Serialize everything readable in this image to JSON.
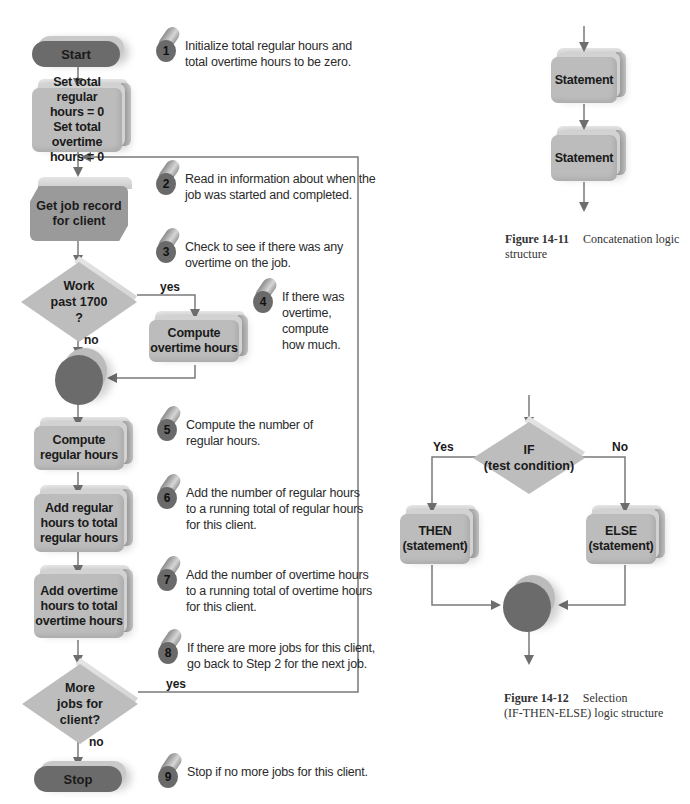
{
  "flowchart": {
    "start": "Start",
    "init": "Set total regular\nhours = 0\nSet total overtime\nhours = 0",
    "get_job": "Get job record\nfor client",
    "decision_overtime": "Work\npast 1700\n?",
    "compute_overtime": "Compute\novertime hours",
    "compute_regular": "Compute\nregular hours",
    "add_regular": "Add regular\nhours to total\nregular hours",
    "add_overtime": "Add overtime\nhours to total\novertime hours",
    "decision_more": "More\njobs for\nclient?",
    "stop": "Stop",
    "labels": {
      "yes_overtime": "yes",
      "no_overtime": "no",
      "yes_more": "yes",
      "no_more": "no"
    }
  },
  "steps": [
    {
      "num": "1",
      "text": "Initialize total regular hours and\ntotal overtime hours to be zero."
    },
    {
      "num": "2",
      "text": "Read in information about when the\njob was started and completed."
    },
    {
      "num": "3",
      "text": "Check to see if there was any\novertime on the job."
    },
    {
      "num": "4",
      "text": "If there was\novertime,\ncompute\nhow much."
    },
    {
      "num": "5",
      "text": "Compute the number of\nregular hours."
    },
    {
      "num": "6",
      "text": "Add the number of regular hours\nto a running total of regular hours\nfor this client."
    },
    {
      "num": "7",
      "text": "Add the number of overtime hours\nto a running total of overtime hours\nfor this client."
    },
    {
      "num": "8",
      "text": "If there are more jobs for this client,\ngo back to Step 2 for the next job."
    },
    {
      "num": "9",
      "text": "Stop if no more jobs for this client."
    }
  ],
  "figure_14_11": {
    "statement_1": "Statement",
    "statement_2": "Statement",
    "caption_number": "Figure 14-11",
    "caption_text": "Concatenation logic structure"
  },
  "figure_14_12": {
    "if_text": "IF\n(test condition)",
    "then_text": "THEN\n(statement)",
    "else_text": "ELSE\n(statement)",
    "yes_label": "Yes",
    "no_label": "No",
    "caption_number": "Figure 14-12",
    "caption_text": "Selection\n(IF-THEN-ELSE) logic structure"
  },
  "colors": {
    "terminal": "#6b6b6b",
    "process": "#bcbcbc",
    "input": "#9a9a9a",
    "line": "#7a7a7a"
  }
}
